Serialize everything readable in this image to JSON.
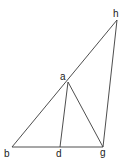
{
  "diagram": {
    "type": "geometric-figure",
    "points": {
      "a": {
        "label": "a",
        "x": 68,
        "y": 82,
        "lx": 60,
        "ly": 80
      },
      "b": {
        "label": "b",
        "x": 12,
        "y": 147,
        "lx": 4,
        "ly": 157
      },
      "d": {
        "label": "d",
        "x": 60,
        "y": 147,
        "lx": 56,
        "ly": 157
      },
      "g": {
        "label": "g",
        "x": 103,
        "y": 147,
        "lx": 100,
        "ly": 156
      },
      "h": {
        "label": "h",
        "x": 117,
        "y": 20,
        "lx": 113,
        "ly": 17
      }
    },
    "segments": [
      [
        "b",
        "h"
      ],
      [
        "b",
        "g"
      ],
      [
        "a",
        "d"
      ],
      [
        "a",
        "g"
      ],
      [
        "h",
        "g"
      ]
    ],
    "colors": {
      "line": "#3a3a3a",
      "label": "#222222",
      "background": "#ffffff"
    }
  }
}
